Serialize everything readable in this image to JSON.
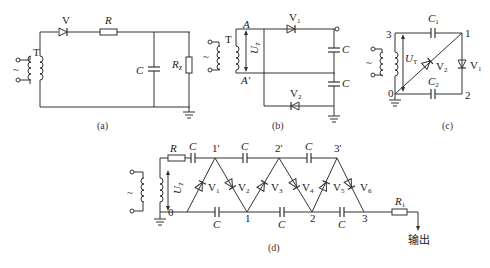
{
  "figure": {
    "panels": {
      "a": {
        "caption": "(a)",
        "transformer": "T",
        "diode": "V",
        "resistor": "R",
        "capacitor": "C",
        "load": "Rz",
        "load_main": "R",
        "load_sub": "z",
        "source": "~"
      },
      "b": {
        "caption": "(b)",
        "transformer": "T",
        "node_top": "A",
        "node_bottom": "A'",
        "voltage": "U",
        "voltage_sub": "T",
        "diode_top": "V",
        "diode_top_sub": "1",
        "diode_bottom": "V",
        "diode_bottom_sub": "2",
        "cap_top": "C",
        "cap_bottom": "C",
        "source": "~"
      },
      "c": {
        "caption": "(c)",
        "node_3": "3",
        "node_1": "1",
        "node_0": "0",
        "node_2": "2",
        "cap_top": "C",
        "cap_top_sub": "1",
        "cap_bottom": "C",
        "cap_bottom_sub": "2",
        "diode_diag": "V",
        "diode_diag_sub": "2",
        "diode_right": "V",
        "diode_right_sub": "1",
        "voltage": "U",
        "voltage_sub": "T",
        "source": "~"
      },
      "d": {
        "caption": "(d)",
        "resistor_in": "R",
        "voltage": "U",
        "voltage_sub": "T",
        "top_nodes": [
          "1'",
          "2'",
          "3'"
        ],
        "bottom_nodes": [
          "0",
          "1",
          "2",
          "3"
        ],
        "caps_top": [
          "C",
          "C",
          "C"
        ],
        "caps_bottom": [
          "C",
          "C",
          "C"
        ],
        "diodes": [
          "V",
          "V",
          "V",
          "V",
          "V",
          "V"
        ],
        "diode_subs": [
          "1",
          "2",
          "3",
          "4",
          "5",
          "6"
        ],
        "resistor_out": "R",
        "resistor_out_sub": "1",
        "output_label": "输出",
        "source": "~"
      }
    }
  }
}
